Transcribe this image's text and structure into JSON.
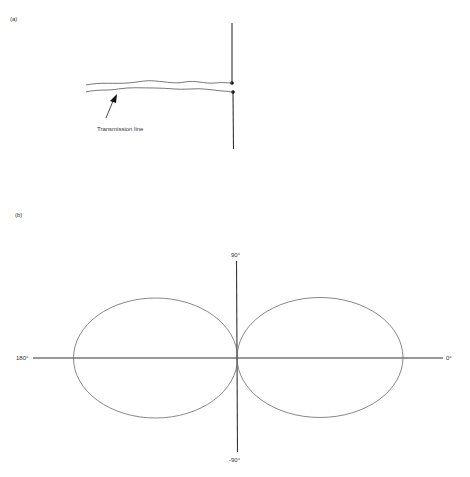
{
  "panel_a": {
    "label": "(a)",
    "annotation": "Transmission line",
    "dipole": {
      "x": 232,
      "upper_arm": [
        23,
        83
      ],
      "lower_arm": [
        92,
        149
      ],
      "feed_points": [
        [
          232,
          83
        ],
        [
          233,
          92
        ]
      ]
    },
    "arrow": {
      "from": [
        106,
        118
      ],
      "to": [
        116,
        96
      ]
    }
  },
  "panel_b": {
    "label": "(b)",
    "axis_labels": {
      "top": "90°",
      "bottom": "-90°",
      "left": "180°",
      "right": "0°"
    },
    "center": [
      237,
      358
    ],
    "lobes": [
      {
        "name": "left",
        "cx": 155,
        "cy": 358,
        "rx": 82,
        "ry": 60
      },
      {
        "name": "right",
        "cx": 320,
        "cy": 358,
        "rx": 83,
        "ry": 60
      }
    ]
  },
  "colors": {
    "line": "#333333",
    "lobe": "#6a6a6a",
    "background": "#ffffff"
  }
}
